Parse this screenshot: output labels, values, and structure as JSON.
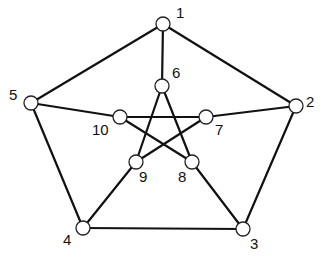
{
  "diagram": {
    "type": "graph",
    "name": "Petersen graph",
    "nodes": [
      {
        "id": "1",
        "label": "1",
        "x": 163,
        "y": 24,
        "lx": 176,
        "ly": 18
      },
      {
        "id": "2",
        "label": "2",
        "x": 296,
        "y": 106,
        "lx": 306,
        "ly": 107
      },
      {
        "id": "3",
        "label": "3",
        "x": 243,
        "y": 229,
        "lx": 250,
        "ly": 249
      },
      {
        "id": "4",
        "label": "4",
        "x": 83,
        "y": 228,
        "lx": 63,
        "ly": 245
      },
      {
        "id": "5",
        "label": "5",
        "x": 31,
        "y": 103,
        "lx": 9,
        "ly": 100
      },
      {
        "id": "6",
        "label": "6",
        "x": 162,
        "y": 86,
        "lx": 172,
        "ly": 78
      },
      {
        "id": "7",
        "label": "7",
        "x": 206,
        "y": 117,
        "lx": 215,
        "ly": 135
      },
      {
        "id": "8",
        "label": "8",
        "x": 192,
        "y": 162,
        "lx": 178,
        "ly": 182
      },
      {
        "id": "9",
        "label": "9",
        "x": 136,
        "y": 162,
        "lx": 139,
        "ly": 182
      },
      {
        "id": "10",
        "label": "10",
        "x": 120,
        "y": 117,
        "lx": 92,
        "ly": 135
      }
    ],
    "edges": [
      [
        "1",
        "2"
      ],
      [
        "2",
        "3"
      ],
      [
        "3",
        "4"
      ],
      [
        "4",
        "5"
      ],
      [
        "5",
        "1"
      ],
      [
        "1",
        "6"
      ],
      [
        "2",
        "7"
      ],
      [
        "3",
        "8"
      ],
      [
        "4",
        "9"
      ],
      [
        "5",
        "10"
      ],
      [
        "6",
        "8"
      ],
      [
        "6",
        "9"
      ],
      [
        "7",
        "9"
      ],
      [
        "7",
        "10"
      ],
      [
        "8",
        "10"
      ]
    ]
  }
}
